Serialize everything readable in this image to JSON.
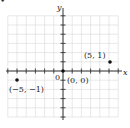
{
  "chart_data": {
    "type": "scatter",
    "title": "",
    "xlabel": "x",
    "ylabel": "y",
    "xlim": [
      -6,
      6
    ],
    "ylim": [
      -5,
      6
    ],
    "grid": true,
    "origin_label": "0",
    "points": [
      {
        "x": -5,
        "y": -1,
        "label": "(−5, −1)"
      },
      {
        "x": 0,
        "y": 0,
        "label": "(0, 0)"
      },
      {
        "x": 5,
        "y": 1,
        "label": "(5, 1)"
      }
    ]
  },
  "colors": {
    "grid": "#d8d8d8",
    "axis": "#333333",
    "point": "#111111"
  },
  "marker": "•"
}
